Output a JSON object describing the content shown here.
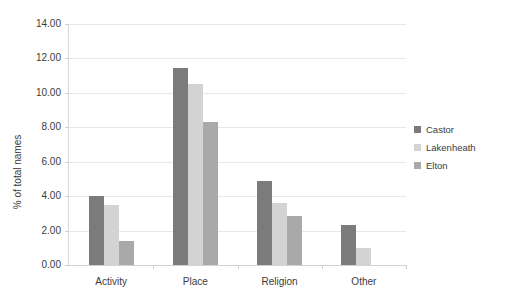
{
  "chart_data": {
    "type": "bar",
    "title": "",
    "subtitle": "",
    "xlabel": "",
    "ylabel": "% of total names",
    "categories": [
      "Activity",
      "Place",
      "Religion",
      "Other"
    ],
    "series": [
      {
        "name": "Castor",
        "color": "#7b7b7b",
        "values": [
          4.0,
          11.45,
          4.9,
          2.35
        ]
      },
      {
        "name": "Lakenheath",
        "color": "#d3d3d3",
        "values": [
          3.5,
          10.5,
          3.6,
          1.0
        ]
      },
      {
        "name": "Elton",
        "color": "#a9a9a9",
        "values": [
          1.4,
          8.3,
          2.85,
          0.0
        ]
      }
    ],
    "ylim": [
      0,
      14
    ],
    "ytick_step": 2,
    "ytick_labels": [
      "0.00",
      "2.00",
      "4.00",
      "6.00",
      "8.00",
      "10.00",
      "12.00",
      "14.00"
    ],
    "grid": true,
    "grid_axis": "y",
    "legend_position": "right",
    "annotations": []
  },
  "colors": {
    "background": "#ffffff",
    "gridline": "#e8e8e8",
    "axis": "#d9d9d9",
    "text": "#3b3b3b"
  }
}
